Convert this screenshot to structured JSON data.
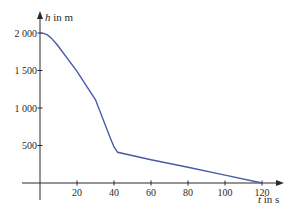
{
  "chart_data": {
    "type": "line",
    "title": "",
    "xlabel_var": "t",
    "xlabel_unit": "in s",
    "ylabel_var": "h",
    "ylabel_unit": "in m",
    "x_ticks": [
      20,
      40,
      60,
      80,
      100,
      120
    ],
    "y_ticks": [
      500,
      1000,
      1500,
      2000
    ],
    "y_tick_labels": [
      "500",
      "1 000",
      "1 500",
      "2 000"
    ],
    "xlim": [
      -9,
      130
    ],
    "ylim": [
      -100,
      2100
    ],
    "grid": false,
    "series": [
      {
        "name": "h(t)",
        "color": "#4a5aa8",
        "points": [
          [
            0,
            2000
          ],
          [
            2,
            1995
          ],
          [
            4,
            1975
          ],
          [
            6,
            1935
          ],
          [
            8,
            1880
          ],
          [
            10,
            1820
          ],
          [
            20,
            1490
          ],
          [
            30,
            1110
          ],
          [
            38,
            600
          ],
          [
            40,
            480
          ],
          [
            42,
            410
          ],
          [
            60,
            310
          ],
          [
            80,
            210
          ],
          [
            100,
            105
          ],
          [
            120,
            0
          ]
        ]
      }
    ]
  }
}
